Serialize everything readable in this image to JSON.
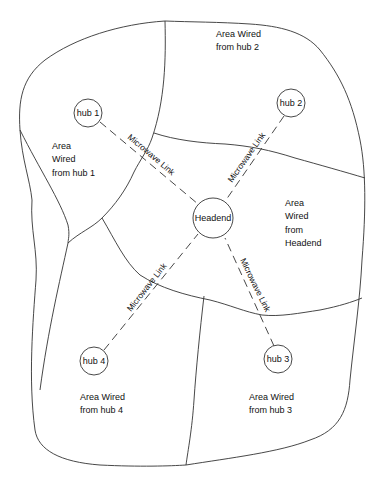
{
  "diagram": {
    "title": "",
    "nodes": [
      {
        "id": "hub1",
        "label": "hub 1"
      },
      {
        "id": "hub2",
        "label": "hub 2"
      },
      {
        "id": "headend",
        "label": "Headend"
      },
      {
        "id": "hub3",
        "label": "hub 3"
      },
      {
        "id": "hub4",
        "label": "hub 4"
      }
    ],
    "links": [
      {
        "from": "hub1",
        "to": "headend",
        "label": "Microwave Link"
      },
      {
        "from": "hub2",
        "to": "headend",
        "label": "Microwave Link"
      },
      {
        "from": "hub4",
        "to": "headend",
        "label": "Microwave Link"
      },
      {
        "from": "hub3",
        "to": "headend",
        "label": "Microwave Link"
      }
    ],
    "areas": {
      "hub1": [
        "Area",
        "Wired",
        "from hub 1"
      ],
      "hub2": [
        "Area Wired",
        "from hub 2"
      ],
      "headend": [
        "Area",
        "Wired",
        "from",
        "Headend"
      ],
      "hub4": [
        "Area Wired",
        "from hub 4"
      ],
      "hub3": [
        "Area Wired",
        "from hub 3"
      ]
    }
  }
}
